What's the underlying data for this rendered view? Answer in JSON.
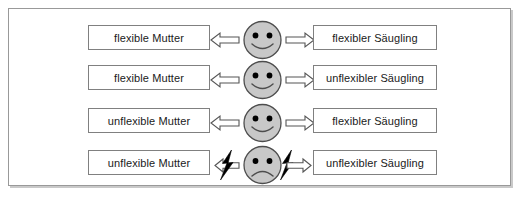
{
  "figure": {
    "language": "de",
    "frame": {
      "border_color": "#999999",
      "background_color": "#ffffff"
    },
    "colors": {
      "face_fill": "#c8c8c8",
      "face_stroke": "#4d4d4d",
      "eye_fill": "#000000",
      "arrow_fill": "#ffffff",
      "arrow_stroke": "#555555",
      "bolt_fill": "#000000",
      "box_border": "#808080",
      "box_fill": "#ffffff",
      "text_color": "#1a1a1a"
    },
    "rows": [
      {
        "id": "row-1",
        "left_label": "flexible Mutter",
        "right_label": "flexibler Säugling",
        "face": "smiling-face",
        "mood": "positive",
        "left_arrow": "arrow-left",
        "right_arrow": "arrow-right",
        "conflict": false
      },
      {
        "id": "row-2",
        "left_label": "flexible Mutter",
        "right_label": "unflexibler Säugling",
        "face": "smiling-face",
        "mood": "positive",
        "left_arrow": "arrow-left",
        "right_arrow": "arrow-right",
        "conflict": false
      },
      {
        "id": "row-3",
        "left_label": "unflexible Mutter",
        "right_label": "flexibler Säugling",
        "face": "smiling-face",
        "mood": "positive",
        "left_arrow": "arrow-left",
        "right_arrow": "arrow-right",
        "conflict": false
      },
      {
        "id": "row-4",
        "left_label": "unflexible Mutter",
        "right_label": "unflexibler Säugling",
        "face": "frowning-face",
        "mood": "negative",
        "left_arrow": "arrow-left",
        "right_arrow": "arrow-right",
        "conflict": true,
        "conflict_icon_left": "lightning-bolt-icon",
        "conflict_icon_right": "lightning-bolt-icon"
      }
    ]
  }
}
